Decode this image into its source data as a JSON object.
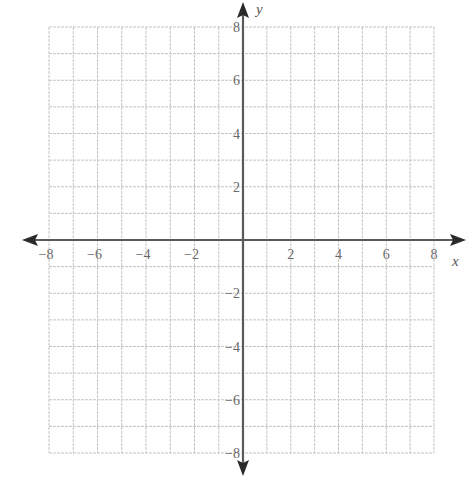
{
  "chart_data": {
    "type": "scatter",
    "title": "",
    "xlabel": "x",
    "ylabel": "y",
    "xlim": [
      -8,
      8
    ],
    "ylim": [
      -8,
      8
    ],
    "grid": true,
    "grid_step": 1,
    "x_ticks": [
      -8,
      -6,
      -4,
      -2,
      2,
      4,
      6,
      8
    ],
    "y_ticks": [
      8,
      6,
      4,
      2,
      -2,
      -4,
      -6,
      -8
    ],
    "x_tick_labels": [
      "−8",
      "−6",
      "−4",
      "−2",
      "2",
      "4",
      "6",
      "8"
    ],
    "y_tick_labels": [
      "8",
      "6",
      "4",
      "2",
      "−2",
      "−4",
      "−6",
      "−8"
    ],
    "series": [],
    "legend": null,
    "colors": {
      "grid": "#c4c4c4",
      "axis": "#5a5a5a",
      "labels": "#6a6a6a"
    }
  },
  "axes": {
    "x_title": "x",
    "y_title": "y"
  }
}
